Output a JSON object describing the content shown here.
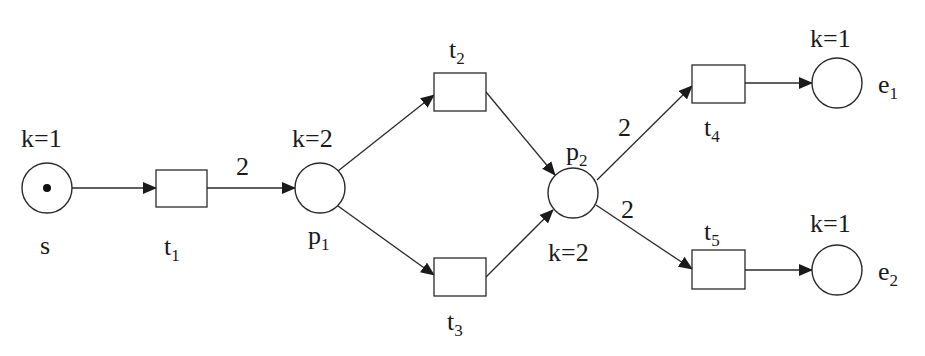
{
  "diagram": {
    "type": "petri-net",
    "colors": {
      "stroke": "#2a2a2a",
      "text": "#1a1a1a",
      "background": "#ffffff",
      "token": "#111111"
    },
    "places": [
      {
        "id": "s",
        "name": "s",
        "sub": "",
        "cx": 47,
        "cy": 188,
        "r": 25,
        "tokens": 1,
        "capacity": "k=1",
        "name_pos": [
          40,
          254
        ],
        "cap_pos": [
          21,
          147
        ]
      },
      {
        "id": "p1",
        "name": "p",
        "sub": "1",
        "cx": 320,
        "cy": 188,
        "r": 25,
        "tokens": 0,
        "capacity": "k=2",
        "name_pos": [
          308,
          244
        ],
        "cap_pos": [
          292,
          147
        ]
      },
      {
        "id": "p2",
        "name": "p",
        "sub": "2",
        "cx": 573,
        "cy": 193,
        "r": 25,
        "tokens": 0,
        "capacity": "k=2",
        "name_pos": [
          566,
          160
        ],
        "cap_pos": [
          548,
          261
        ]
      },
      {
        "id": "e1",
        "name": "e",
        "sub": "1",
        "cx": 837,
        "cy": 83,
        "r": 25,
        "tokens": 0,
        "capacity": "k=1",
        "name_pos": [
          878,
          93
        ],
        "cap_pos": [
          810,
          47
        ]
      },
      {
        "id": "e2",
        "name": "e",
        "sub": "2",
        "cx": 837,
        "cy": 270,
        "r": 25,
        "tokens": 0,
        "capacity": "k=1",
        "name_pos": [
          878,
          280
        ],
        "cap_pos": [
          810,
          232
        ]
      }
    ],
    "transitions": [
      {
        "id": "t1",
        "name": "t",
        "sub": "1",
        "x": 156,
        "y": 170,
        "w": 51,
        "h": 37,
        "label_pos": [
          164,
          255
        ]
      },
      {
        "id": "t2",
        "name": "t",
        "sub": "2",
        "x": 434,
        "y": 73,
        "w": 52,
        "h": 38,
        "label_pos": [
          449,
          58
        ]
      },
      {
        "id": "t3",
        "name": "t",
        "sub": "3",
        "x": 434,
        "y": 258,
        "w": 52,
        "h": 38,
        "label_pos": [
          447,
          330
        ]
      },
      {
        "id": "t4",
        "name": "t",
        "sub": "4",
        "x": 692,
        "y": 65,
        "w": 53,
        "h": 38,
        "label_pos": [
          704,
          136
        ]
      },
      {
        "id": "t5",
        "name": "t",
        "sub": "5",
        "x": 692,
        "y": 250,
        "w": 53,
        "h": 39,
        "label_pos": [
          704,
          240
        ]
      }
    ],
    "arcs": [
      {
        "id": "s-t1",
        "from": "s",
        "to": "t1",
        "x1": 72,
        "y1": 188,
        "x2": 156,
        "y2": 188,
        "weight": ""
      },
      {
        "id": "t1-p1",
        "from": "t1",
        "to": "p1",
        "x1": 207,
        "y1": 188,
        "x2": 295,
        "y2": 188,
        "weight": "2",
        "weight_pos": [
          236,
          175
        ]
      },
      {
        "id": "p1-t2",
        "from": "p1",
        "to": "t2",
        "x1": 338,
        "y1": 171,
        "x2": 434,
        "y2": 95,
        "weight": ""
      },
      {
        "id": "p1-t3",
        "from": "p1",
        "to": "t3",
        "x1": 338,
        "y1": 206,
        "x2": 434,
        "y2": 275,
        "weight": ""
      },
      {
        "id": "t2-p2",
        "from": "t2",
        "to": "p2",
        "x1": 486,
        "y1": 92,
        "x2": 555,
        "y2": 175,
        "weight": ""
      },
      {
        "id": "t3-p2",
        "from": "t3",
        "to": "p2",
        "x1": 486,
        "y1": 277,
        "x2": 553,
        "y2": 210,
        "weight": ""
      },
      {
        "id": "p2-t4",
        "from": "p2",
        "to": "t4",
        "x1": 597,
        "y1": 180,
        "x2": 692,
        "y2": 86,
        "weight": "2",
        "weight_pos": [
          618,
          136
        ]
      },
      {
        "id": "p2-t5",
        "from": "p2",
        "to": "t5",
        "x1": 596,
        "y1": 205,
        "x2": 692,
        "y2": 269,
        "weight": "2",
        "weight_pos": [
          621,
          218
        ]
      },
      {
        "id": "t4-e1",
        "from": "t4",
        "to": "e1",
        "x1": 745,
        "y1": 83,
        "x2": 812,
        "y2": 83,
        "weight": ""
      },
      {
        "id": "t5-e2",
        "from": "t5",
        "to": "e2",
        "x1": 745,
        "y1": 270,
        "x2": 812,
        "y2": 270,
        "weight": ""
      }
    ]
  }
}
